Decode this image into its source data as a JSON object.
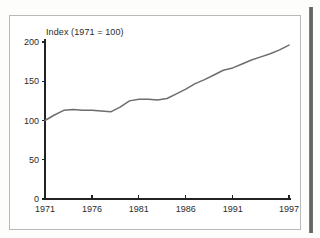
{
  "page": {
    "background_color": "#fdfdfc",
    "paper_color": "#ffffff",
    "border_color": "#b9b9b9",
    "spine_color": "#5c5c5c"
  },
  "chart_data": {
    "type": "line",
    "title": "Index (1971 = 100)",
    "xlabel": "",
    "ylabel": "",
    "grid": false,
    "legend": "none",
    "line_color": "#6d6d6d",
    "axis_color": "#222222",
    "xlim": [
      1971,
      1997
    ],
    "ylim": [
      0,
      200
    ],
    "yticks": [
      0,
      50,
      100,
      150,
      200
    ],
    "ytick_labels": [
      "0",
      "50",
      "100",
      "150",
      "200"
    ],
    "xticks": [
      1971,
      1976,
      1981,
      1986,
      1991,
      1997
    ],
    "xtick_labels": [
      "1971",
      "1976",
      "1981",
      "1986",
      "1991",
      "1997"
    ],
    "x": [
      1971,
      1972,
      1973,
      1974,
      1975,
      1976,
      1977,
      1978,
      1979,
      1980,
      1981,
      1982,
      1983,
      1984,
      1985,
      1986,
      1987,
      1988,
      1989,
      1990,
      1991,
      1992,
      1993,
      1994,
      1995,
      1996,
      1997
    ],
    "values": [
      100,
      107,
      113,
      114,
      113,
      113,
      112,
      111,
      117,
      125,
      127,
      127,
      126,
      128,
      134,
      140,
      147,
      152,
      158,
      164,
      167,
      172,
      177,
      181,
      185,
      190,
      196
    ],
    "series": [
      {
        "name": "Index",
        "values": [
          100,
          107,
          113,
          114,
          113,
          113,
          112,
          111,
          117,
          125,
          127,
          127,
          126,
          128,
          134,
          140,
          147,
          152,
          158,
          164,
          167,
          172,
          177,
          181,
          185,
          190,
          196
        ]
      }
    ]
  }
}
